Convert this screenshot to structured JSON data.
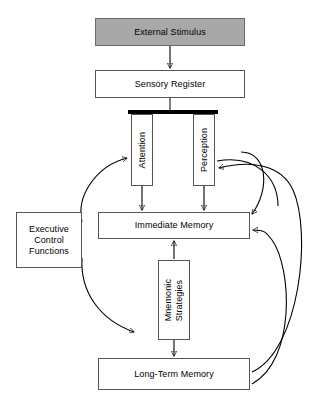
{
  "diagram": {
    "background_color": "#ffffff",
    "nodes": {
      "external_stimulus": {
        "label": "External Stimulus",
        "fill": "#a8a8a8",
        "orientation": "horizontal"
      },
      "sensory_register": {
        "label": "Sensory Register",
        "fill": "#ffffff",
        "orientation": "horizontal"
      },
      "attention": {
        "label": "Attention",
        "fill": "#ffffff",
        "orientation": "vertical"
      },
      "perception": {
        "label": "Perception",
        "fill": "#ffffff",
        "orientation": "vertical"
      },
      "immediate_memory": {
        "label": "Immediate Memory",
        "fill": "#ffffff",
        "orientation": "horizontal"
      },
      "executive_control": {
        "label": "Executive\nControl\nFunctions",
        "fill": "#ffffff",
        "orientation": "horizontal"
      },
      "mnemonic_strategies": {
        "label": "Mnemonic\nStrategies",
        "fill": "#ffffff",
        "orientation": "vertical"
      },
      "longterm_memory": {
        "label": "Long-Term Memory",
        "fill": "#ffffff",
        "orientation": "horizontal"
      }
    },
    "edges": [
      {
        "from": "external_stimulus",
        "to": "sensory_register",
        "style": "straight",
        "arrow": "end"
      },
      {
        "from": "sensory_register",
        "to": "splitter_bar",
        "style": "straight",
        "arrow": "none"
      },
      {
        "from": "attention",
        "to": "immediate_memory",
        "style": "straight",
        "arrow": "end"
      },
      {
        "from": "perception",
        "to": "immediate_memory",
        "style": "straight",
        "arrow": "end"
      },
      {
        "from": "mnemonic_strategies",
        "to": "immediate_memory",
        "style": "straight",
        "arrow": "end"
      },
      {
        "from": "mnemonic_strategies",
        "to": "longterm_memory",
        "style": "straight",
        "arrow": "end"
      },
      {
        "from": "executive_control",
        "to": "attention",
        "style": "curved",
        "arrow": "end"
      },
      {
        "from": "executive_control",
        "to": "mnemonic_strategies",
        "style": "curved",
        "arrow": "end"
      },
      {
        "from": "longterm_memory",
        "to": "perception",
        "style": "curved",
        "arrow": "end"
      },
      {
        "from": "longterm_memory",
        "to": "immediate_memory",
        "style": "curved",
        "arrow": "end"
      },
      {
        "from": "perception",
        "to": "longterm_memory",
        "style": "curved",
        "arrow": "end"
      },
      {
        "from": "immediate_memory",
        "to": "longterm_memory",
        "style": "curved",
        "arrow": "end"
      }
    ]
  }
}
